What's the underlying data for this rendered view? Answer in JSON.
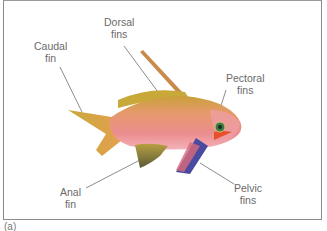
{
  "figure": {
    "caption": "(a)",
    "labels": {
      "dorsal": [
        "Dorsal",
        "fins"
      ],
      "caudal": [
        "Caudal",
        "fin"
      ],
      "pectoral": [
        "Pectoral",
        "fins"
      ],
      "anal": [
        "Anal",
        "fin"
      ],
      "pelvic": [
        "Pelvic",
        "fins"
      ]
    },
    "colors": {
      "body": "#e98a86",
      "body_top": "#d8a83a",
      "tail": "#d8b63a",
      "eye": "#3c7a4a",
      "pectoral": "#e8502a",
      "pelvic": "#4a4aa0",
      "leader": "#6e6e6e"
    }
  }
}
